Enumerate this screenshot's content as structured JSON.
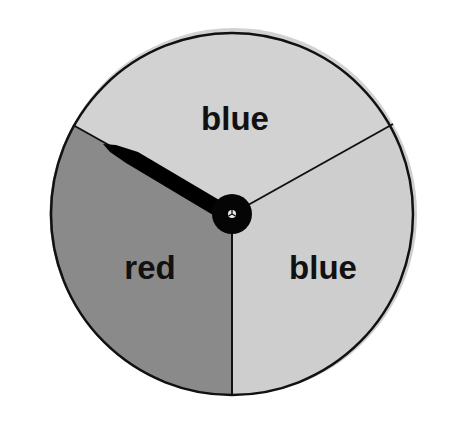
{
  "spinner": {
    "center": {
      "x": 232,
      "y": 214
    },
    "radius": 181,
    "outline_color": "#111111",
    "sectors": [
      {
        "id": "top",
        "label": "blue",
        "fill": "#d2d2d2",
        "label_pos": {
          "x": 235,
          "y": 130
        }
      },
      {
        "id": "right",
        "label": "blue",
        "fill": "#cecece",
        "label_pos": {
          "x": 323,
          "y": 279
        }
      },
      {
        "id": "left",
        "label": "red",
        "fill": "#8a8a8a",
        "label_pos": {
          "x": 150,
          "y": 279
        }
      }
    ],
    "dividers": [
      {
        "from": "center",
        "to": {
          "x": 73,
          "y": 125
        }
      },
      {
        "from": "center",
        "to": {
          "x": 393,
          "y": 124
        }
      },
      {
        "from": "center",
        "to": {
          "x": 232,
          "y": 395
        }
      }
    ],
    "needle": {
      "color": "#000000",
      "tip": {
        "x": 103,
        "y": 144
      },
      "points_to": "red"
    },
    "hub": {
      "radius": 20,
      "color": "#050505"
    }
  }
}
